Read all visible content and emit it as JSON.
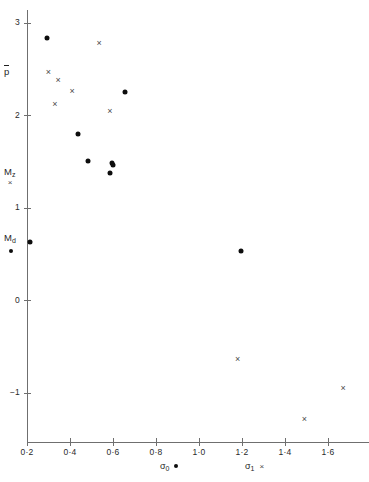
{
  "figure": {
    "background": "#ffffff",
    "marker_dot_color": "#0d0d0d",
    "marker_cross_color": "#4a4a4a",
    "axis_color": "#6f6f6f"
  },
  "axes": {
    "y": {
      "label": "",
      "ticks": [
        "3",
        "2",
        "1",
        "0",
        "−1"
      ],
      "tick_values": [
        3,
        2,
        1,
        0,
        -1
      ],
      "range": [
        -1.55,
        3.2
      ]
    },
    "x": {
      "label": "",
      "ticks": [
        "0·2",
        "0·4",
        "0·6",
        "0·8",
        "1·0",
        "1·2",
        "1·4",
        "1·6"
      ],
      "tick_values": [
        0.2,
        0.4,
        0.6,
        0.8,
        1.0,
        1.2,
        1.4,
        1.6
      ],
      "range": [
        0.17,
        1.78
      ]
    }
  },
  "y_annotations": [
    {
      "text": "p",
      "overline": true,
      "sub": "",
      "value": 2.45
    },
    {
      "text": "M",
      "overline": false,
      "sub": "z",
      "value": 1.37
    },
    {
      "text": "M",
      "overline": false,
      "sub": "d",
      "value": 0.66
    }
  ],
  "legend": {
    "y_axis_items": [
      {
        "label_main": "M",
        "label_sub": "z",
        "marker": "cross"
      },
      {
        "label_main": "M",
        "label_sub": "d",
        "marker": "dot"
      },
      {
        "label_main": "p",
        "label_sub": "",
        "marker": "none"
      }
    ],
    "x_axis_items": [
      {
        "label_main": "σ",
        "label_sub": "0",
        "marker": "dot"
      },
      {
        "label_main": "σ",
        "label_sub": "1",
        "marker": "cross"
      }
    ]
  },
  "chart_data": {
    "type": "scatter",
    "title": "",
    "xlabel": "",
    "ylabel": "",
    "xlim": [
      0.17,
      1.78
    ],
    "ylim": [
      -1.55,
      3.2
    ],
    "grid": false,
    "legend_position": "axis-labels",
    "series": [
      {
        "name": "σ₀ (dot)",
        "marker": "dot",
        "color": "#0d0d0d",
        "points": [
          {
            "x": 0.295,
            "y": 2.83
          },
          {
            "x": 0.655,
            "y": 2.25
          },
          {
            "x": 0.435,
            "y": 1.79
          },
          {
            "x": 0.485,
            "y": 1.5
          },
          {
            "x": 0.595,
            "y": 1.48
          },
          {
            "x": 0.6,
            "y": 1.46
          },
          {
            "x": 0.585,
            "y": 1.37
          },
          {
            "x": 0.215,
            "y": 0.63
          },
          {
            "x": 1.195,
            "y": 0.53
          }
        ]
      },
      {
        "name": "σ₁ (cross)",
        "marker": "cross",
        "color": "#4a4a4a",
        "points": [
          {
            "x": 0.535,
            "y": 2.78
          },
          {
            "x": 0.3,
            "y": 2.46
          },
          {
            "x": 0.345,
            "y": 2.38
          },
          {
            "x": 0.41,
            "y": 2.26
          },
          {
            "x": 0.33,
            "y": 2.12
          },
          {
            "x": 0.585,
            "y": 2.04
          },
          {
            "x": 1.18,
            "y": -0.64
          },
          {
            "x": 1.67,
            "y": -0.95
          },
          {
            "x": 1.49,
            "y": -1.29
          }
        ]
      }
    ]
  }
}
